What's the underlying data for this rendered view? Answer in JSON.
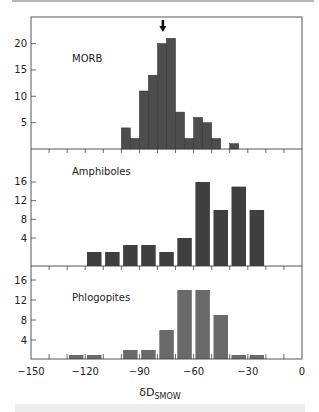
{
  "chart_data": {
    "type": "bar",
    "layout": "three stacked histogram panels sharing x-axis",
    "xlabel": "δD",
    "xlabel_subscript": "SMOW",
    "xlim": [
      -150,
      0
    ],
    "x_ticks": [
      -150,
      -120,
      -90,
      -60,
      -30,
      0
    ],
    "x_minor_step": 10,
    "grid": false,
    "panels": [
      {
        "name": "MORB",
        "label": "MORB",
        "bar_width": 5,
        "contiguous": true,
        "color": "#4d4d4d",
        "y_ticks": [
          5,
          10,
          15,
          20
        ],
        "ylim": [
          0,
          24
        ],
        "bins_start": [
          -100,
          -95,
          -90,
          -85,
          -80,
          -75,
          -70,
          -65,
          -60,
          -55,
          -50,
          -40
        ],
        "values": [
          4,
          2,
          11,
          14,
          20,
          21,
          7,
          2,
          6,
          5,
          2,
          1
        ],
        "annotation": {
          "type": "arrow-down",
          "x": -77
        }
      },
      {
        "name": "Amphiboles",
        "label": "Amphiboles",
        "bar_width": 8,
        "contiguous": false,
        "color": "#3f3f3f",
        "y_ticks": [
          4,
          8,
          12,
          16
        ],
        "ylim": [
          -2,
          20
        ],
        "bin_centers": [
          -115,
          -105,
          -95,
          -85,
          -75,
          -65,
          -55,
          -45,
          -35,
          -25
        ],
        "values": [
          1,
          1,
          2.5,
          2.5,
          1,
          4,
          16,
          10,
          15,
          10
        ]
      },
      {
        "name": "Phlogopites",
        "label": "Phlogopites",
        "bar_width": 8,
        "contiguous": false,
        "color": "#6a6a6a",
        "y_ticks": [
          4,
          8,
          12,
          16
        ],
        "ylim": [
          0,
          19
        ],
        "bin_centers": [
          -125,
          -115,
          -95,
          -85,
          -75,
          -65,
          -55,
          -45,
          -35,
          -25
        ],
        "values": [
          1,
          1,
          2,
          2,
          6,
          14,
          14,
          9,
          1,
          1
        ]
      }
    ]
  }
}
